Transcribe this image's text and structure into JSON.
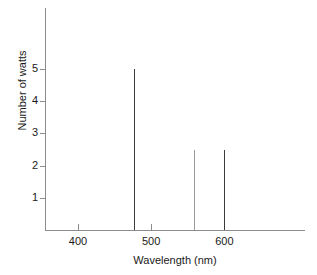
{
  "chart_data": {
    "type": "bar",
    "subtype": "line-spectrum",
    "title": "",
    "subtitle": "",
    "xlabel": "Wavelength (nm)",
    "ylabel": "Number of watts",
    "xlim": [
      355,
      710
    ],
    "ylim": [
      0,
      6.9
    ],
    "grid": false,
    "legend": null,
    "x_ticks": [
      400,
      500,
      600
    ],
    "x_tick_labels": [
      "400",
      "500",
      "600"
    ],
    "y_ticks": [
      1,
      2,
      3,
      4,
      5
    ],
    "y_tick_labels": [
      "1",
      "2",
      "3",
      "4",
      "5"
    ],
    "x": [
      477,
      558,
      600
    ],
    "values": [
      5.0,
      2.5,
      2.5
    ],
    "categories": [
      "477",
      "558",
      "600"
    ],
    "series": [
      {
        "name": "Emission lines",
        "points": [
          {
            "wavelength": 477,
            "watts": 5.0,
            "color": "#3c3c3c"
          },
          {
            "wavelength": 558,
            "watts": 2.5,
            "color": "#9a9a9a"
          },
          {
            "wavelength": 600,
            "watts": 2.5,
            "color": "#3c3c3c"
          }
        ]
      }
    ],
    "annotations": []
  },
  "style": {
    "background": "#ffffff",
    "axis_color": "#8c8c8c",
    "text_color": "#1a1a1a"
  }
}
